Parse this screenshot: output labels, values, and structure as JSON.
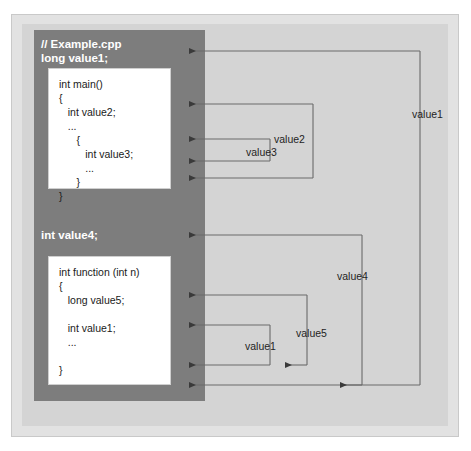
{
  "diagram": {
    "title_comment": "// Example.cpp",
    "global_declaration": "long value1;",
    "second_global_declaration": "int value4;",
    "code_main": "int main()\n{\n   int value2;\n   ...\n      {\n         int value3;\n         ...\n      }\n}",
    "code_function": "int function (int n)\n{\n   long value5;\n\n   int value1;\n   ...\n\n}",
    "scope_labels": {
      "value3": "value3",
      "value2": "value2",
      "value1_outer": "value1",
      "value4": "value4",
      "value5": "value5",
      "value1_inner": "value1"
    },
    "colors": {
      "panel": "#7d7d7d",
      "background": "#d4d4d4",
      "frame": "#e2e2e2",
      "code_box": "#ffffff",
      "line": "#555555",
      "panel_text": "#ffffff"
    }
  }
}
